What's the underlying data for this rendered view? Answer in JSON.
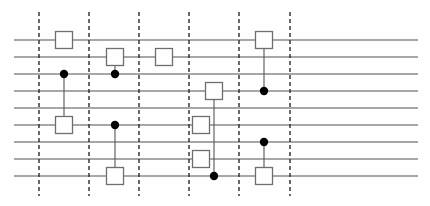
{
  "diagram": {
    "type": "quantum-circuit",
    "width": 430,
    "height": 206,
    "colors": {
      "background": "#ffffff",
      "wire": "#8a8a8a",
      "barrier": "#2b2b2b",
      "gate_border": "#6e6e6e",
      "gate_fill": "#ffffff",
      "control_dot": "#000000",
      "connector": "#555555"
    },
    "wires": {
      "x_start": 14,
      "x_end": 418,
      "y": [
        40,
        57,
        74,
        91,
        108,
        125,
        142,
        159,
        176
      ]
    },
    "barriers": {
      "x": [
        39,
        89,
        139,
        189,
        239,
        290
      ],
      "y_start": 12,
      "y_end": 196
    },
    "gate_size": 17,
    "dot_radius": 4.2,
    "operations": [
      {
        "column": 1,
        "x": 64,
        "kind": "single",
        "wire": 0
      },
      {
        "column": 1,
        "x": 64,
        "kind": "controlled",
        "control": 2,
        "target": 5
      },
      {
        "column": 2,
        "x": 115,
        "kind": "controlled",
        "control": 2,
        "target": 1
      },
      {
        "column": 2,
        "x": 115,
        "kind": "controlled",
        "control": 5,
        "target": 8
      },
      {
        "column": 3,
        "x": 164,
        "kind": "single",
        "wire": 1
      },
      {
        "column": 4,
        "x": 201,
        "kind": "single",
        "wire": 5
      },
      {
        "column": 4,
        "x": 201,
        "kind": "single",
        "wire": 7
      },
      {
        "column": 4,
        "x": 214,
        "kind": "controlled",
        "control": 8,
        "target": 3
      },
      {
        "column": 5,
        "x": 264,
        "kind": "controlled",
        "control": 3,
        "target": 0
      },
      {
        "column": 5,
        "x": 264,
        "kind": "controlled",
        "control": 6,
        "target": 8
      }
    ]
  }
}
